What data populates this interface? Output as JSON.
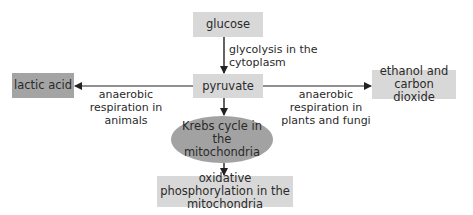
{
  "diagram": {
    "type": "flowchart",
    "nodes": {
      "glucose": "glucose",
      "pyruvate": "pyruvate",
      "lactic_acid": "lactic acid",
      "ethanol": "ethanol and carbon dioxide",
      "krebs": "Krebs cycle in the mitochondria",
      "oxidative": "oxidative phosphorylation in the mitochondria"
    },
    "edge_labels": {
      "glycolysis": "glycolysis in the cytoplasm",
      "anaerobic_animals": "anaerobic respiration in animals",
      "anaerobic_plants": "anaerobic respiration in plants and fungi"
    },
    "edges": [
      {
        "from": "glucose",
        "to": "pyruvate",
        "label": "glycolysis in the cytoplasm"
      },
      {
        "from": "pyruvate",
        "to": "lactic acid",
        "label": "anaerobic respiration in animals"
      },
      {
        "from": "pyruvate",
        "to": "ethanol and carbon dioxide",
        "label": "anaerobic respiration in plants and fungi"
      },
      {
        "from": "pyruvate",
        "to": "Krebs cycle in the mitochondria",
        "label": ""
      },
      {
        "from": "Krebs cycle in the mitochondria",
        "to": "oxidative phosphorylation in the mitochondria",
        "label": ""
      }
    ],
    "colors": {
      "light_box": "#d8d8d8",
      "dark_box": "#a4a4a4",
      "ellipse": "#a2a2a2",
      "arrow": "#222222"
    }
  }
}
